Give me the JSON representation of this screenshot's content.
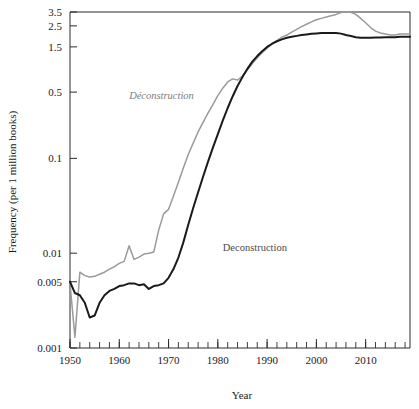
{
  "chart_data": {
    "type": "line",
    "title": "",
    "xlabel": "Year",
    "ylabel": "Frequency (per 1 million books)",
    "xlim": [
      1950,
      2019
    ],
    "ylim": [
      0.001,
      3.5
    ],
    "yscale": "log",
    "grid": false,
    "legend_position": "inline-annotation",
    "x_tick_labels": [
      "1950",
      "1960",
      "1970",
      "1980",
      "1990",
      "2000",
      "2010"
    ],
    "x_ticks": [
      1950,
      1960,
      1970,
      1980,
      1990,
      2000,
      2010
    ],
    "x_minor_tick_step": 2,
    "y_tick_labels": [
      "3.5",
      "2.5",
      "1.5",
      "0.5",
      "0.1",
      "0.01",
      "0.005",
      "0.001"
    ],
    "y_ticks": [
      3.5,
      2.5,
      1.5,
      0.5,
      0.1,
      0.01,
      0.005,
      0.001
    ],
    "colors": {
      "deconstruction_fr": "#9a9a9a",
      "deconstruction_en": "#1a1a1a",
      "axis": "#2b2b2b",
      "background": "#ffffff"
    },
    "series": [
      {
        "name": "Déconstruction",
        "language": "French",
        "style": "italic",
        "color": "#9a9a9a",
        "label_x": 1962,
        "label_y": 0.42,
        "x": [
          1950,
          1951,
          1952,
          1953,
          1954,
          1955,
          1956,
          1957,
          1958,
          1959,
          1960,
          1961,
          1962,
          1963,
          1964,
          1965,
          1966,
          1967,
          1968,
          1969,
          1970,
          1971,
          1972,
          1973,
          1974,
          1975,
          1976,
          1977,
          1978,
          1979,
          1980,
          1981,
          1982,
          1983,
          1984,
          1985,
          1986,
          1987,
          1988,
          1989,
          1990,
          1991,
          1992,
          1993,
          1994,
          1995,
          1996,
          1997,
          1998,
          1999,
          2000,
          2001,
          2002,
          2003,
          2004,
          2005,
          2006,
          2007,
          2008,
          2009,
          2010,
          2011,
          2012,
          2013,
          2014,
          2015,
          2016,
          2017,
          2018,
          2019
        ],
        "values": [
          0.0048,
          0.0013,
          0.0063,
          0.0058,
          0.0056,
          0.0057,
          0.006,
          0.0063,
          0.0068,
          0.0072,
          0.0078,
          0.0082,
          0.012,
          0.0086,
          0.0091,
          0.0098,
          0.01,
          0.0103,
          0.0175,
          0.026,
          0.029,
          0.04,
          0.056,
          0.079,
          0.11,
          0.145,
          0.19,
          0.24,
          0.3,
          0.37,
          0.46,
          0.55,
          0.64,
          0.69,
          0.67,
          0.74,
          0.86,
          1.0,
          1.15,
          1.3,
          1.45,
          1.6,
          1.75,
          1.9,
          2.0,
          2.15,
          2.3,
          2.45,
          2.6,
          2.75,
          2.9,
          3.0,
          3.1,
          3.2,
          3.3,
          3.45,
          3.5,
          3.48,
          3.3,
          3.0,
          2.7,
          2.4,
          2.2,
          2.1,
          2.05,
          2.0,
          2.0,
          2.05,
          2.05,
          2.05
        ]
      },
      {
        "name": "Deconstruction",
        "language": "English",
        "style": "regular",
        "color": "#1a1a1a",
        "label_x": 1981,
        "label_y": 0.0105,
        "x": [
          1950,
          1951,
          1952,
          1953,
          1954,
          1955,
          1956,
          1957,
          1958,
          1959,
          1960,
          1961,
          1962,
          1963,
          1964,
          1965,
          1966,
          1967,
          1968,
          1969,
          1970,
          1971,
          1972,
          1973,
          1974,
          1975,
          1976,
          1977,
          1978,
          1979,
          1980,
          1981,
          1982,
          1983,
          1984,
          1985,
          1986,
          1987,
          1988,
          1989,
          1990,
          1991,
          1992,
          1993,
          1994,
          1995,
          1996,
          1997,
          1998,
          1999,
          2000,
          2001,
          2002,
          2003,
          2004,
          2005,
          2006,
          2007,
          2008,
          2009,
          2010,
          2011,
          2012,
          2013,
          2014,
          2015,
          2016,
          2017,
          2018,
          2019
        ],
        "values": [
          0.005,
          0.0038,
          0.0036,
          0.003,
          0.0021,
          0.0022,
          0.003,
          0.0036,
          0.004,
          0.0042,
          0.0045,
          0.0046,
          0.0048,
          0.0048,
          0.0046,
          0.0047,
          0.0042,
          0.0045,
          0.0046,
          0.0048,
          0.0055,
          0.0068,
          0.009,
          0.013,
          0.02,
          0.03,
          0.044,
          0.064,
          0.092,
          0.13,
          0.18,
          0.25,
          0.34,
          0.45,
          0.58,
          0.72,
          0.88,
          1.05,
          1.2,
          1.35,
          1.5,
          1.62,
          1.72,
          1.8,
          1.87,
          1.92,
          1.96,
          2.0,
          2.03,
          2.06,
          2.08,
          2.1,
          2.1,
          2.1,
          2.1,
          2.07,
          2.0,
          1.95,
          1.9,
          1.87,
          1.87,
          1.87,
          1.88,
          1.88,
          1.9,
          1.9,
          1.9,
          1.92,
          1.92,
          1.92
        ]
      }
    ]
  }
}
